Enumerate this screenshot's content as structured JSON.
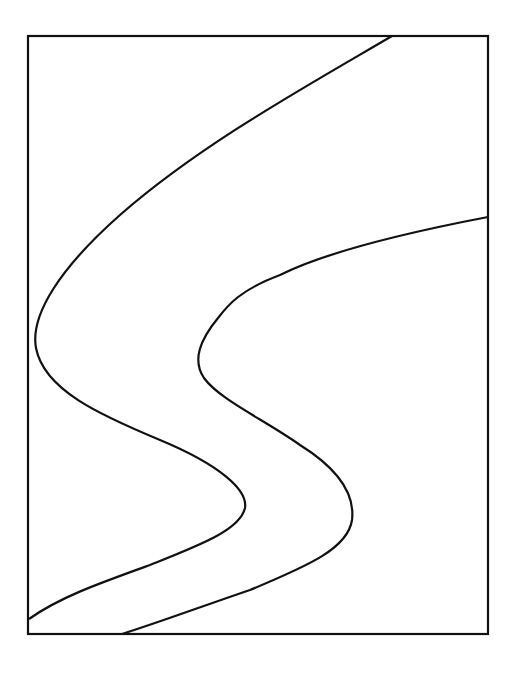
{
  "figure": {
    "background": "#ffffff",
    "stroke_color": "#111111",
    "frame": {
      "x": 28,
      "y": 36,
      "width": 460,
      "height": 598
    },
    "curves": [
      {
        "name": "left-s-curve",
        "path": "M 392 36 C 300 90, 200 145, 120 215 C 60 268, 30 315, 36 348 C 44 390, 100 415, 160 440 C 220 465, 248 490, 245 508 C 240 530, 200 545, 150 565 C 100 583, 60 597, 29 619"
      },
      {
        "name": "right-s-curve",
        "path": "M 488 217 C 420 230, 330 250, 280 275 C 240 290, 228 305, 218 318 C 200 340, 192 360, 204 378 C 220 400, 265 420, 300 445 C 340 470, 355 495, 352 520 C 348 548, 310 565, 250 590 C 200 607, 160 622, 122 634"
      }
    ]
  }
}
